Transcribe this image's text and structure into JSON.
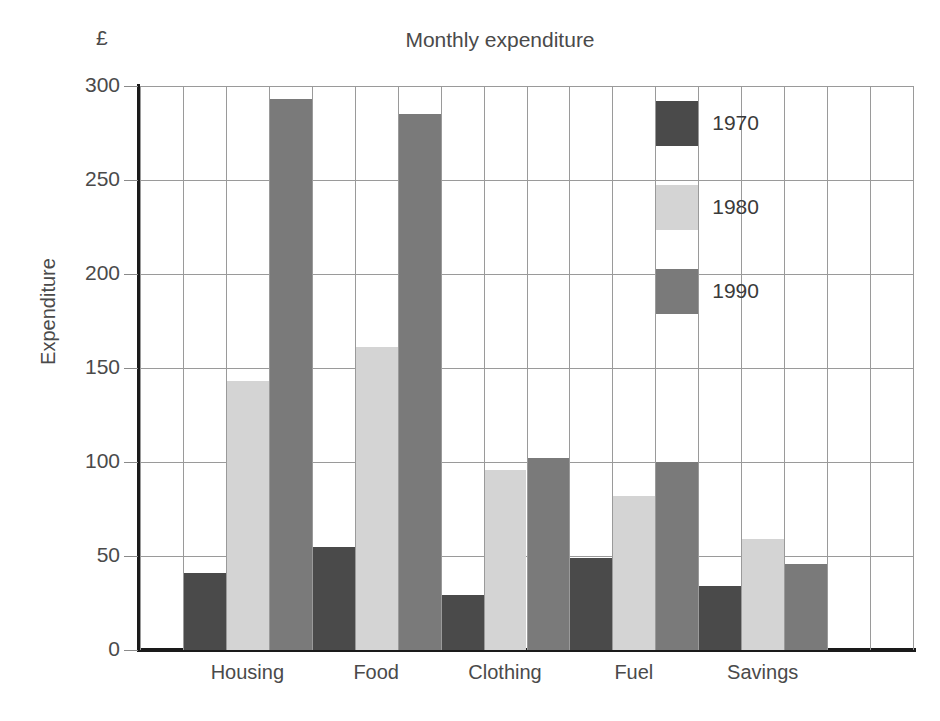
{
  "chart_data": {
    "type": "bar",
    "title": "Monthly expenditure",
    "currency_symbol": "£",
    "xlabel": "",
    "ylabel": "Expenditure",
    "categories": [
      "Housing",
      "Food",
      "Clothing",
      "Fuel",
      "Savings"
    ],
    "series": [
      {
        "name": "1970",
        "color": "#4a4a4a",
        "values": [
          41,
          55,
          29,
          49,
          34
        ]
      },
      {
        "name": "1980",
        "color": "#d4d4d4",
        "values": [
          143,
          161,
          96,
          82,
          59
        ]
      },
      {
        "name": "1990",
        "color": "#7a7a7a",
        "values": [
          293,
          285,
          102,
          100,
          46
        ]
      }
    ],
    "ylim": [
      0,
      300
    ],
    "yticks": [
      0,
      50,
      100,
      150,
      200,
      250,
      300
    ],
    "ytick_labels": [
      "0",
      "50",
      "100",
      "150",
      "200",
      "250",
      "300"
    ],
    "grid": true,
    "grid_color": "#9a9a9a",
    "axis_color": "#1a1a1a",
    "legend_position": "inside-top-right",
    "legend": [
      {
        "label": "1970",
        "color": "#4a4a4a"
      },
      {
        "label": "1980",
        "color": "#d4d4d4"
      },
      {
        "label": "1990",
        "color": "#7a7a7a"
      }
    ]
  }
}
